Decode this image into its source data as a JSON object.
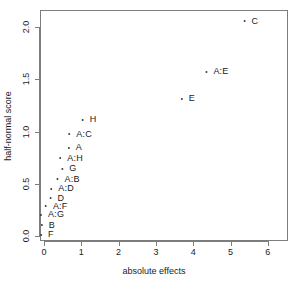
{
  "chart_data": {
    "type": "scatter",
    "title": "",
    "xlabel": "absolute effects",
    "ylabel": "half-normal score",
    "xlim": [
      -0.1,
      6.6
    ],
    "ylim": [
      -0.06,
      2.2
    ],
    "grid": false,
    "legend": null,
    "xticks": [
      "0",
      "1",
      "2",
      "3",
      "4",
      "5",
      "6"
    ],
    "xtick_values": [
      0,
      1,
      2,
      3,
      4,
      5,
      6
    ],
    "yticks": [
      "0.0",
      "0.5",
      "1.0",
      "1.5",
      "2.0"
    ],
    "ytick_values": [
      0.0,
      0.5,
      1.0,
      1.5,
      2.0
    ],
    "point_label_position": "right",
    "points": [
      {
        "label": "C",
        "x": 5.52,
        "y": 2.07
      },
      {
        "label": "A:E",
        "x": 4.61,
        "y": 1.59
      },
      {
        "label": "E",
        "x": 3.83,
        "y": 1.33
      },
      {
        "label": "H",
        "x": 1.18,
        "y": 1.13
      },
      {
        "label": "A:C",
        "x": 0.94,
        "y": 0.99
      },
      {
        "label": "A",
        "x": 0.8,
        "y": 0.86
      },
      {
        "label": "A:H",
        "x": 0.7,
        "y": 0.76
      },
      {
        "label": "G",
        "x": 0.64,
        "y": 0.66
      },
      {
        "label": "A:B",
        "x": 0.62,
        "y": 0.56
      },
      {
        "label": "A:D",
        "x": 0.46,
        "y": 0.47
      },
      {
        "label": "D",
        "x": 0.32,
        "y": 0.38
      },
      {
        "label": "A:F",
        "x": 0.3,
        "y": 0.3
      },
      {
        "label": "A:G",
        "x": 0.19,
        "y": 0.22
      },
      {
        "label": "B",
        "x": 0.08,
        "y": 0.12
      },
      {
        "label": "F",
        "x": 0.05,
        "y": 0.03
      }
    ]
  },
  "colors": {
    "point": "#3c3c3c",
    "text": "#1a1a1a",
    "axis": "#7d7d7d",
    "background": "#ffffff"
  }
}
